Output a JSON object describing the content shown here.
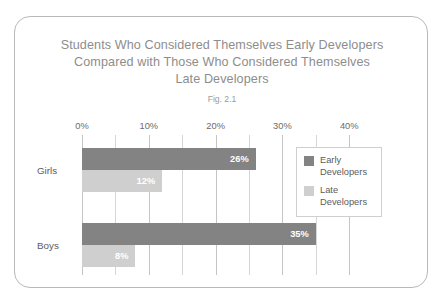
{
  "figure": {
    "title_lines": [
      "Students Who Considered Themselves Early Developers",
      "Compared with Those Who Considered Themselves",
      "Late Developers"
    ],
    "caption": "Fig. 2.1"
  },
  "colors": {
    "early": "#838383",
    "late": "#cfcfcf",
    "frame": "#b9b9b9",
    "gridline": "#d6d6d6",
    "title_text": "#8d8d8d",
    "label_text": "#5c5c5c",
    "value_text": "#ffffff"
  },
  "chart_data": {
    "type": "bar",
    "orientation": "horizontal",
    "title": "Students Who Considered Themselves Early Developers Compared with Those Who Considered Themselves Late Developers",
    "subtitle": "Fig. 2.1",
    "xlabel": "",
    "ylabel": "",
    "categories": [
      "Girls",
      "Boys"
    ],
    "series": [
      {
        "name": "Early Developers",
        "values": [
          26,
          35
        ],
        "labels": [
          "26%",
          "35%"
        ],
        "color": "#838383"
      },
      {
        "name": "Late Developers",
        "values": [
          12,
          8
        ],
        "labels": [
          "12%",
          "8%"
        ],
        "color": "#cfcfcf"
      }
    ],
    "xlim": [
      0,
      45
    ],
    "xticks": [
      0,
      10,
      20,
      30,
      40
    ],
    "xtick_labels": [
      "0%",
      "10%",
      "20%",
      "30%",
      "40%"
    ],
    "minor_gridlines": [
      5,
      15,
      25,
      35
    ],
    "grid": true,
    "legend_position": "upper right",
    "legend_entries": [
      "Early Developers",
      "Late Developers"
    ]
  }
}
